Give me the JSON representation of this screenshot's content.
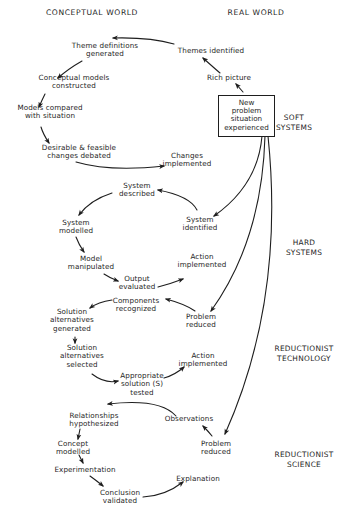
{
  "headings": {
    "left": "CONCEPTUAL  WORLD",
    "right": "REAL    WORLD"
  },
  "start_box": "New\nproblem\nsituation\nexperienced",
  "domains": [
    {
      "id": "soft",
      "label": "SOFT\nSYSTEMS"
    },
    {
      "id": "hard",
      "label": "HARD\nSYSTEMS"
    },
    {
      "id": "red_tech",
      "label": "REDUCTIONIST\nTECHNOLOGY"
    },
    {
      "id": "red_sci",
      "label": "REDUCTIONIST\nSCIENCE"
    }
  ],
  "nodes": {
    "soft": {
      "rich_picture": "Rich picture",
      "themes_identified": "Themes identified",
      "theme_definitions": "Theme definitions\ngenerated",
      "conceptual_models": "Conceptual models\nconstructed",
      "models_compared": "Models compared\nwith situation",
      "changes_debated": "Desirable & feasible\nchanges debated",
      "changes_implemented": "Changes\nimplemented"
    },
    "hard": {
      "system_identified": "System\nidentified",
      "system_described": "System\ndescribed",
      "system_modelled": "System\nmodelled",
      "model_manipulated": "Model\nmanipulated",
      "output_evaluated": "Output\nevaluated",
      "action_implemented": "Action\nimplemented"
    },
    "red_tech": {
      "problem_reduced": "Problem\nreduced",
      "components_recognized": "Components\nrecognized",
      "alternatives_generated": "Solution\nalternatives\ngenerated",
      "alternatives_selected": "Solution\nalternatives\nselected",
      "solution_tested": "Appropriate\nsolution  (S)\ntested",
      "action_implemented": "Action\nimplemented"
    },
    "red_sci": {
      "problem_reduced": "Problem\nreduced",
      "observations": "Observations",
      "relationships": "Relationships\nhypothesized",
      "concept_modelled": "Concept\nmodelled",
      "experimentation": "Experimentation",
      "conclusion_validated": "Conclusion\nvalidated",
      "explanation": "Explanation"
    }
  },
  "colors": {
    "ink": "#1e1e1e",
    "background": "#ffffff"
  }
}
